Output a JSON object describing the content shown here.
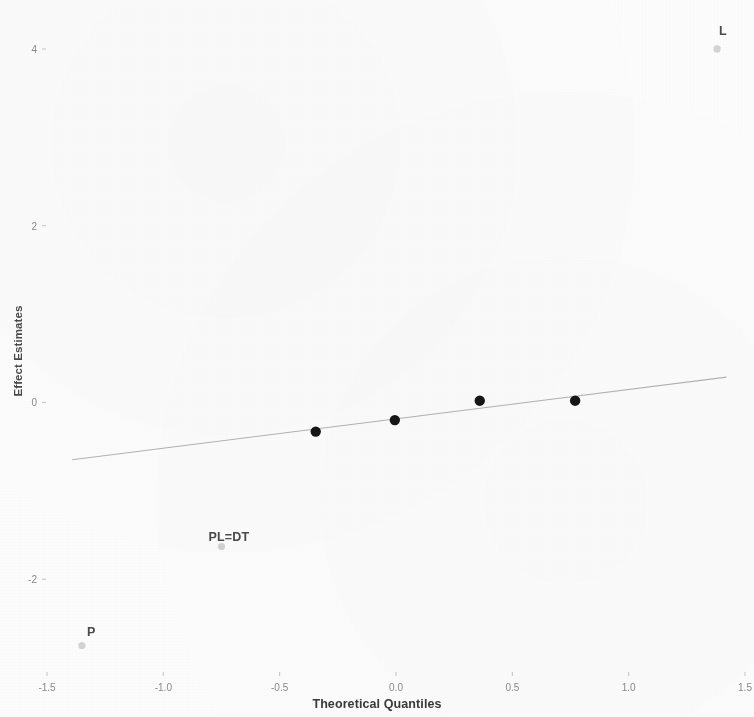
{
  "chart_data": {
    "type": "scatter",
    "title": "",
    "subtitle": "",
    "xlabel": "Theoretical Quantiles",
    "ylabel": "Effect Estimates",
    "xlim": [
      -1.5,
      1.5
    ],
    "ylim": [
      -3.05,
      4.35
    ],
    "grid": false,
    "legend": null,
    "x_ticks": [
      {
        "value": -1.5,
        "label": "-1.5"
      },
      {
        "value": -1.0,
        "label": "-1.0"
      },
      {
        "value": -0.5,
        "label": "-0.5"
      },
      {
        "value": 0.0,
        "label": "0.0"
      },
      {
        "value": 0.5,
        "label": "0.5"
      },
      {
        "value": 1.0,
        "label": "1.0"
      },
      {
        "value": 1.5,
        "label": "1.5"
      }
    ],
    "y_ticks": [
      {
        "value": 4,
        "label": "4"
      },
      {
        "value": 2,
        "label": "2"
      },
      {
        "value": 0,
        "label": "0"
      },
      {
        "value": -2,
        "label": "-2"
      }
    ],
    "series": [
      {
        "name": "unlabeled effects",
        "marker": "filled-circle",
        "color": "#161616",
        "size": 5.2,
        "points": [
          {
            "x": -0.345,
            "y": -0.33,
            "label": ""
          },
          {
            "x": -0.005,
            "y": -0.2,
            "label": ""
          },
          {
            "x": 0.36,
            "y": 0.02,
            "label": ""
          },
          {
            "x": 0.77,
            "y": 0.02,
            "label": ""
          }
        ]
      },
      {
        "name": "labeled effects",
        "marker": "open-circle",
        "color": "#b9b9b9",
        "size": 3.6,
        "points": [
          {
            "x": 1.38,
            "y": 4.0,
            "label": "L"
          },
          {
            "x": -0.75,
            "y": -1.63,
            "label": "PL=DT"
          },
          {
            "x": -1.35,
            "y": -2.75,
            "label": "P"
          }
        ]
      }
    ],
    "reference_line": {
      "name": "normal-qq-reference-line",
      "color": "#9a9aa0",
      "x1": -1.392,
      "y1": -0.648,
      "x2": 1.42,
      "y2": 0.286
    },
    "annotations": [
      {
        "text": "L",
        "x": 1.405,
        "y": 4.2
      },
      {
        "text": "PL=DT",
        "x": -0.718,
        "y": -1.52
      },
      {
        "text": "P",
        "x": -1.31,
        "y": -2.6
      }
    ]
  },
  "axes": {
    "x_title": "Theoretical Quantiles",
    "y_title": "Effect Estimates"
  },
  "colors": {
    "background": "#fcfcfc",
    "marker_dark": "#161616",
    "marker_light": "#b9b9b9",
    "line": "#9a9aa0",
    "tick_text": "#8a8a8a",
    "title_text": "#3a3a3a"
  }
}
